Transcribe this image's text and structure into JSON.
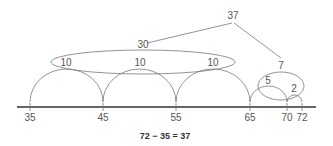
{
  "diagram": {
    "type": "empty-number-line",
    "colors": {
      "line": "#333333",
      "arc": "#777777",
      "text": "#555555"
    },
    "ticks": [
      {
        "label": "35",
        "x": 30
      },
      {
        "label": "45",
        "x": 103
      },
      {
        "label": "55",
        "x": 176
      },
      {
        "label": "65",
        "x": 250
      },
      {
        "label": "70",
        "x": 287
      },
      {
        "label": "72",
        "x": 302
      }
    ],
    "jumps": [
      {
        "label": "10",
        "from": "35",
        "to": "45"
      },
      {
        "label": "10",
        "from": "45",
        "to": "55"
      },
      {
        "label": "10",
        "from": "55",
        "to": "65"
      },
      {
        "label": "5",
        "from": "65",
        "to": "70"
      },
      {
        "label": "2",
        "from": "70",
        "to": "72"
      }
    ],
    "groups": [
      {
        "label": "30",
        "contains": [
          "10",
          "10",
          "10"
        ]
      },
      {
        "label": "7",
        "contains": [
          "5",
          "2"
        ]
      }
    ],
    "total": {
      "label": "37",
      "sum_of": [
        "30",
        "7"
      ]
    },
    "equation": "72 − 35 = 37"
  }
}
